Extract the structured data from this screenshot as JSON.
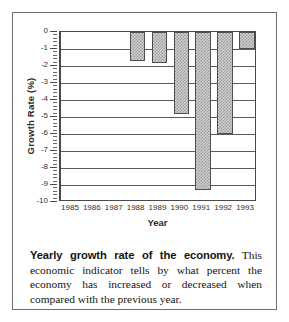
{
  "figure": {
    "caption_lead": "Yearly growth rate of the economy.",
    "caption_body": " This economic indicator tells by what percent the economy has increased or decreased when compared with the previous year."
  },
  "chart_data": {
    "type": "bar",
    "title": "",
    "xlabel": "Year",
    "ylabel": "Growth Rate (%)",
    "categories": [
      "1985",
      "1986",
      "1987",
      "1988",
      "1989",
      "1990",
      "1991",
      "1992",
      "1993"
    ],
    "values": [
      0,
      0,
      0,
      -1.7,
      -1.8,
      -4.8,
      -9.3,
      -6.0,
      -1.0
    ],
    "ylim": [
      -10,
      0
    ],
    "ytick_labels": [
      "0",
      "-1",
      "-2",
      "-3",
      "-4",
      "-5",
      "-6",
      "-7",
      "-8",
      "-9",
      "-10"
    ],
    "ytick_values": [
      0,
      -1,
      -2,
      -3,
      -4,
      -5,
      -6,
      -7,
      -8,
      -9,
      -10
    ],
    "minor_ticks_per_interval": 4,
    "grid": "horizontal",
    "legend": "none",
    "bar_fill": "gray-crosshatch",
    "bar_edge_color": "#4f4f4f",
    "bar_fill_color": "#cfcfcf",
    "axis_color": "#4a4a4a"
  }
}
